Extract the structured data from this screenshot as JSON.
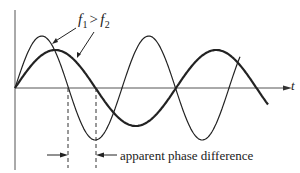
{
  "figure": {
    "label_f1": "f",
    "label_f1_sub": "1",
    "label_gt": ">",
    "label_f2": "f",
    "label_f2_sub": "2",
    "axis_label_t": "t",
    "annotation": "apparent phase difference",
    "colors": {
      "ink": "#222222",
      "axis": "#555555",
      "background": "#ffffff"
    }
  },
  "chart_data": {
    "type": "line",
    "title": "",
    "xlabel": "t",
    "ylabel": "",
    "grid": false,
    "origin_px": [
      15,
      88
    ],
    "series": [
      {
        "name": "f1 (higher frequency, thin)",
        "period_px": 107,
        "amplitude_px": 52,
        "x_end_px": 240,
        "stroke_width": 1.2
      },
      {
        "name": "f2 (lower frequency, thick)",
        "period_px": 161,
        "amplitude_px": 38,
        "x_end_px": 268,
        "stroke_width": 2.2
      }
    ],
    "markers": [
      {
        "type": "dashed-vline",
        "x_px": 68,
        "meaning": "f1 zero crossing"
      },
      {
        "type": "dashed-vline",
        "x_px": 96,
        "meaning": "f2 zero crossing"
      }
    ],
    "annotations": [
      "f1 > f2",
      "apparent phase difference"
    ]
  }
}
